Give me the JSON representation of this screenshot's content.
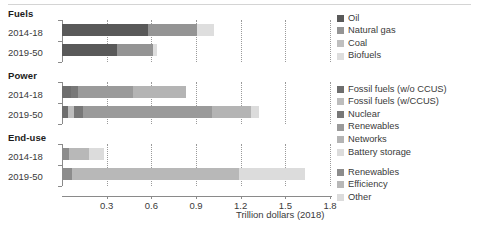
{
  "chart_data": {
    "type": "bar",
    "orientation": "horizontal",
    "stacked": true,
    "title": "",
    "xlabel": "Trillion dollars (2018)",
    "ylabel": "",
    "xlim": [
      0,
      1.8
    ],
    "xticks": [
      0.3,
      0.6,
      0.9,
      1.2,
      1.5,
      1.8
    ],
    "xticklabels": [
      "0.3",
      "0.6",
      "0.9",
      "1.2",
      "1.5",
      "1.8"
    ],
    "grid": "vertical-dotted",
    "legend_position": "right",
    "panels": [
      {
        "name": "Fuels",
        "categories": [
          "2014-18",
          "2019-50"
        ],
        "series": [
          {
            "name": "Oil",
            "color": "#595959",
            "values": [
              0.58,
              0.37
            ]
          },
          {
            "name": "Natural gas",
            "color": "#949494",
            "values": [
              0.33,
              0.24
            ]
          },
          {
            "name": "Coal",
            "color": "#bfbfbf",
            "values": [
              0.0,
              0.0
            ]
          },
          {
            "name": "Biofuels",
            "color": "#dedede",
            "values": [
              0.11,
              0.03
            ]
          }
        ],
        "totals": [
          1.02,
          0.64
        ]
      },
      {
        "name": "Power",
        "categories": [
          "2014-18",
          "2019-50"
        ],
        "series": [
          {
            "name": "Fossil fuels (w/o CCUS)",
            "color": "#6e6e6e",
            "values": [
              0.06,
              0.04
            ]
          },
          {
            "name": "Fossil fuels (w/CCUS)",
            "color": "#bdbdbd",
            "values": [
              0.0,
              0.04
            ]
          },
          {
            "name": "Nuclear",
            "color": "#787878",
            "values": [
              0.05,
              0.06
            ]
          },
          {
            "name": "Renewables",
            "color": "#9a9a9a",
            "values": [
              0.37,
              0.87
            ]
          },
          {
            "name": "Networks",
            "color": "#b4b4b4",
            "values": [
              0.35,
              0.26
            ]
          },
          {
            "name": "Battery storage",
            "color": "#dcdcdc",
            "values": [
              0.0,
              0.05
            ]
          }
        ],
        "totals": [
          0.83,
          1.32
        ]
      },
      {
        "name": "End-use",
        "categories": [
          "2014-18",
          "2019-50"
        ],
        "series": [
          {
            "name": "Renewables",
            "color": "#8c8c8c",
            "values": [
              0.05,
              0.07
            ]
          },
          {
            "name": "Efficiency",
            "color": "#b8b8b8",
            "values": [
              0.13,
              1.12
            ]
          },
          {
            "name": "Other",
            "color": "#dcdcdc",
            "values": [
              0.1,
              0.44
            ]
          }
        ],
        "totals": [
          0.28,
          1.63
        ]
      }
    ]
  },
  "axis": {
    "title": "Trillion dollars (2018)",
    "ticklabels": [
      "0.3",
      "0.6",
      "0.9",
      "1.2",
      "1.5",
      "1.8"
    ]
  },
  "panels": {
    "fuels": {
      "title": "Fuels",
      "rows": [
        "2014-18",
        "2019-50"
      ]
    },
    "power": {
      "title": "Power",
      "rows": [
        "2014-18",
        "2019-50"
      ]
    },
    "enduse": {
      "title": "End-use",
      "rows": [
        "2014-18",
        "2019-50"
      ]
    }
  },
  "legends": {
    "fuels": [
      {
        "label": "Oil",
        "color": "#595959"
      },
      {
        "label": "Natural gas",
        "color": "#949494"
      },
      {
        "label": "Coal",
        "color": "#bfbfbf"
      },
      {
        "label": "Biofuels",
        "color": "#dedede"
      }
    ],
    "power": [
      {
        "label": "Fossil fuels (w/o CCUS)",
        "color": "#6e6e6e"
      },
      {
        "label": "Fossil fuels (w/CCUS)",
        "color": "#bdbdbd"
      },
      {
        "label": "Nuclear",
        "color": "#787878"
      },
      {
        "label": "Renewables",
        "color": "#9a9a9a"
      },
      {
        "label": "Networks",
        "color": "#b4b4b4"
      },
      {
        "label": "Battery storage",
        "color": "#dcdcdc"
      }
    ],
    "enduse": [
      {
        "label": "Renewables",
        "color": "#8c8c8c"
      },
      {
        "label": "Efficiency",
        "color": "#b8b8b8"
      },
      {
        "label": "Other",
        "color": "#dcdcdc"
      }
    ]
  }
}
